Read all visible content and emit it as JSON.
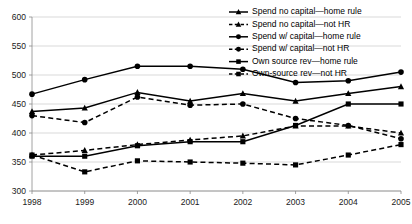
{
  "chart_data": {
    "type": "line",
    "title": "",
    "subtitle": "",
    "xlabel": "",
    "ylabel": "",
    "grid": true,
    "legend_position": "top-right",
    "x": [
      "1998",
      "1999",
      "2000",
      "2001",
      "2002",
      "2003",
      "2004",
      "2005"
    ],
    "categories": [
      "1998",
      "1999",
      "2000",
      "2001",
      "2002",
      "2003",
      "2004",
      "2005"
    ],
    "xlim": [
      1998,
      2005
    ],
    "ylim": [
      300,
      600
    ],
    "ytick_labels": [
      "300",
      "350",
      "400",
      "450",
      "500",
      "550",
      "600"
    ],
    "ytick_values": [
      300,
      350,
      400,
      450,
      500,
      550,
      600
    ],
    "xtick_labels": [
      "1998",
      "1999",
      "2000",
      "2001",
      "2002",
      "2003",
      "2004",
      "2005"
    ],
    "series": [
      {
        "name": "Spend no capital—home rule",
        "marker": "triangle",
        "style": "solid",
        "values": [
          437,
          443,
          470,
          455,
          468,
          455,
          468,
          480
        ]
      },
      {
        "name": "Spend no capital—not HR",
        "marker": "triangle",
        "style": "dashed",
        "values": [
          362,
          370,
          380,
          388,
          395,
          412,
          412,
          400
        ]
      },
      {
        "name": "Spend w/ capital—home rule",
        "marker": "circle",
        "style": "solid",
        "values": [
          467,
          492,
          515,
          515,
          510,
          487,
          490,
          505
        ]
      },
      {
        "name": "Spend w/ capital—not HR",
        "marker": "circle",
        "style": "dashed",
        "values": [
          430,
          418,
          462,
          448,
          450,
          425,
          413,
          390
        ]
      },
      {
        "name": "Own source rev—home rule",
        "marker": "square",
        "style": "solid",
        "values": [
          360,
          360,
          378,
          385,
          385,
          413,
          450,
          450
        ]
      },
      {
        "name": "Own-source rev—not HR",
        "marker": "square",
        "style": "dashed",
        "values": [
          362,
          333,
          352,
          350,
          348,
          345,
          362,
          380
        ]
      }
    ]
  },
  "legend": {
    "items": [
      {
        "label": "Spend no capital—home rule"
      },
      {
        "label": "Spend no capital—not HR"
      },
      {
        "label": "Spend w/ capital—home rule"
      },
      {
        "label": "Spend w/ capital—not HR"
      },
      {
        "label": "Own source rev—home rule"
      },
      {
        "label": "Own-source rev—not HR"
      }
    ]
  },
  "colors": {
    "ink": "#000000",
    "grid": "#c9c9c9",
    "axis": "#8a8a8a",
    "background": "#ffffff"
  }
}
